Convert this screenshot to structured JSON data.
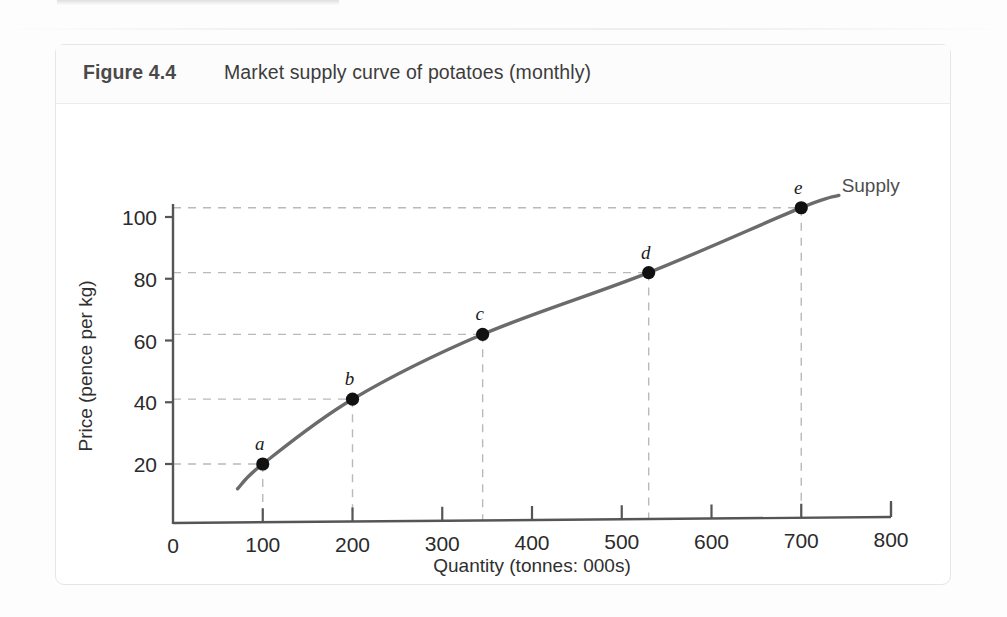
{
  "figure": {
    "number": "Figure 4.4",
    "title": "Market supply curve of potatoes (monthly)"
  },
  "chart_data": {
    "type": "line",
    "title": "Market supply curve of potatoes (monthly)",
    "xlabel": "Quantity (tonnes: 000s)",
    "ylabel": "Price (pence per kg)",
    "xlim": [
      0,
      800
    ],
    "ylim": [
      0,
      115
    ],
    "xticks": [
      0,
      100,
      200,
      300,
      400,
      500,
      600,
      700,
      800
    ],
    "xtick_labels": [
      "0",
      "100",
      "200",
      "300",
      "400",
      "500",
      "600",
      "700",
      "800"
    ],
    "yticks": [
      20,
      40,
      60,
      80,
      100
    ],
    "ytick_labels": [
      "20",
      "40",
      "60",
      "80",
      "100"
    ],
    "grid": "dashed-guides-to-points",
    "legend_position": "end-of-curve",
    "series": [
      {
        "name": "Supply",
        "point_labels": [
          "a",
          "b",
          "c",
          "d",
          "e"
        ],
        "x": [
          100,
          200,
          345,
          530,
          700
        ],
        "y": [
          20,
          41,
          62,
          82,
          103
        ]
      }
    ],
    "annotations": [
      {
        "text": "Supply",
        "x": 745,
        "y": 108
      }
    ],
    "colors": {
      "curve": "#6b6b6b",
      "point": "#111111",
      "axis": "#555555",
      "gridline": "#b9b9b9"
    }
  }
}
